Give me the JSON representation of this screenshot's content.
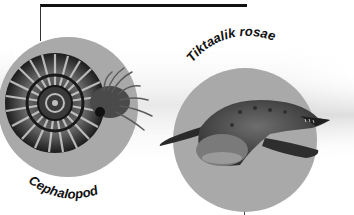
{
  "figure": {
    "labels": {
      "left": "Cephalopod",
      "right": "Tiktaalik rosae"
    },
    "colors": {
      "circle": "#a9a9a9",
      "line": "#111111",
      "label": "#111111",
      "background": "#ffffff",
      "band": "#d8d8d8"
    },
    "items": [
      {
        "name": "Cephalopod",
        "depiction": "ammonite-shell-with-tentacles"
      },
      {
        "name": "Tiktaalik rosae",
        "depiction": "tetrapod-fish"
      }
    ]
  }
}
